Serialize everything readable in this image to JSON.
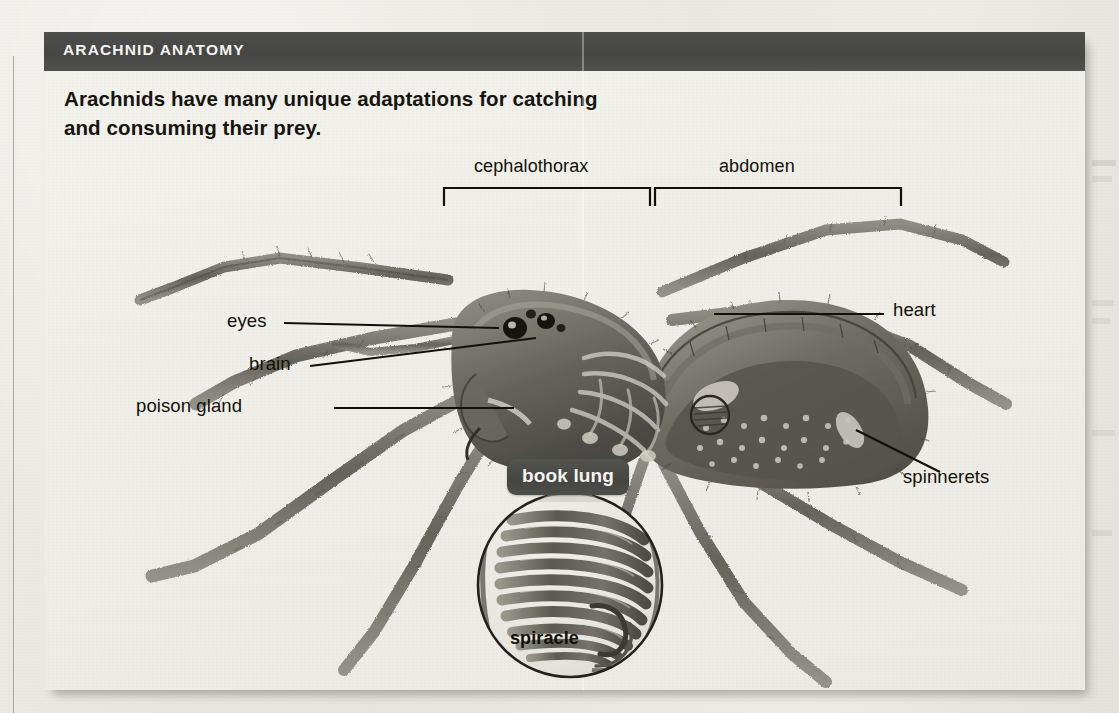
{
  "header": {
    "title": "ARACHNID ANATOMY",
    "bar_color": "#484846",
    "title_color": "#f4f3f0"
  },
  "subtitle": {
    "line1": "Arachnids have many unique adaptations for catching",
    "line2": "and consuming their prey."
  },
  "diagram": {
    "brackets": [
      {
        "id": "cephalothorax",
        "label": "cephalothorax",
        "x1": 400,
        "x2": 606,
        "label_x": 430,
        "label_y": 36
      },
      {
        "id": "abdomen",
        "label": "abdomen",
        "x1": 609,
        "x2": 857,
        "label_x": 675,
        "label_y": 36
      }
    ],
    "callouts": [
      {
        "id": "eyes",
        "label": "eyes",
        "label_x": 183,
        "label_y": 179,
        "side": "left"
      },
      {
        "id": "brain",
        "label": "brain",
        "label_x": 205,
        "label_y": 222,
        "side": "left"
      },
      {
        "id": "poison-gland",
        "label": "poison gland",
        "label_x": 92,
        "label_y": 263,
        "side": "left"
      },
      {
        "id": "heart",
        "label": "heart",
        "label_x": 849,
        "label_y": 167,
        "side": "right"
      },
      {
        "id": "spinnerets",
        "label": "spinnerets",
        "label_x": 859,
        "label_y": 336,
        "side": "right"
      }
    ],
    "chip": {
      "id": "book-lung",
      "label": "book lung"
    },
    "magnifier": {
      "id": "book-lung-detail",
      "center_x": 526,
      "center_y": 443,
      "radius": 93,
      "inner_label": "spiracle",
      "inner_label_x": 466,
      "inner_label_y": 495,
      "lamellae_count": 10
    },
    "body_marker": {
      "id": "book-lung-location-circle",
      "center_x": 666,
      "center_y": 273,
      "radius": 19
    },
    "colors": {
      "ink": "#121109",
      "artwork_dark": "#4d4b44",
      "artwork_mid": "#7f7d74",
      "artwork_light": "#b8b5ab",
      "paper": "#efeee8"
    }
  }
}
